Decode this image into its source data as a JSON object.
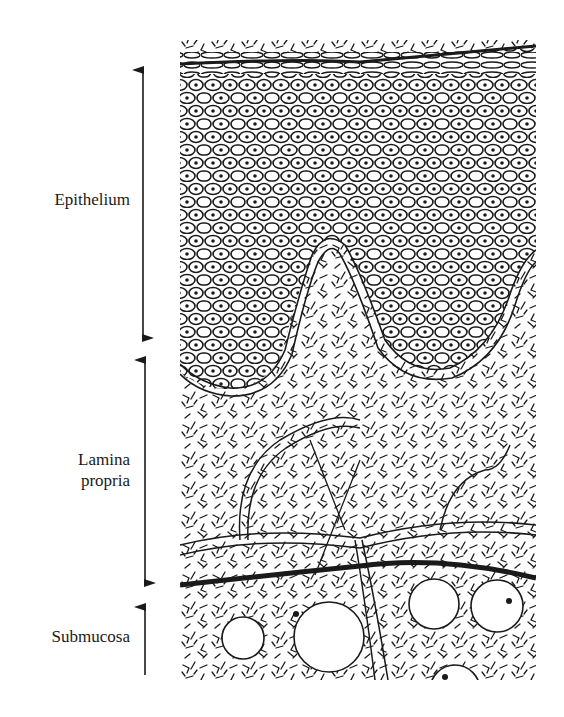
{
  "diagram": {
    "type": "histology-cross-section",
    "layers": [
      {
        "id": "epithelium",
        "label": "Epithelium"
      },
      {
        "id": "lamina-propria",
        "label_line1": "Lamina",
        "label_line2": "propria"
      },
      {
        "id": "submucosa",
        "label": "Submucosa"
      }
    ],
    "colors": {
      "ink": "#1a1a1a",
      "background": "#ffffff"
    }
  }
}
